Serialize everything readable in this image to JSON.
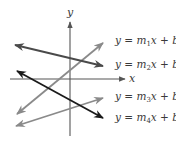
{
  "diagram": {
    "axes": {
      "x_label": "x",
      "y_label": "y",
      "axis_color": "#555555"
    },
    "lines": [
      {
        "id": "line-1",
        "label": "y = m1x + b1",
        "label_parts": {
          "prefix": "y = ",
          "m": "m",
          "m_sub": "1",
          "x": "x",
          "plus": " + ",
          "b": "b",
          "b_sub": "1"
        },
        "direction": "rising",
        "color": "#8a8a8a"
      },
      {
        "id": "line-2",
        "label": "y = m2x + b2",
        "label_parts": {
          "prefix": "y = ",
          "m": "m",
          "m_sub": "2",
          "x": "x",
          "plus": " + ",
          "b": "b",
          "b_sub": "2"
        },
        "direction": "falling",
        "color": "#4a4a4a"
      },
      {
        "id": "line-3",
        "label": "y = m3x + b3",
        "label_parts": {
          "prefix": "y = ",
          "m": "m",
          "m_sub": "3",
          "x": "x",
          "plus": " + ",
          "b": "b",
          "b_sub": "3"
        },
        "direction": "rising",
        "color": "#8a8a8a"
      },
      {
        "id": "line-4",
        "label": "y = m4x + b4",
        "label_parts": {
          "prefix": "y = ",
          "m": "m",
          "m_sub": "4",
          "x": "x",
          "plus": " + ",
          "b": "b",
          "b_sub": "4"
        },
        "direction": "falling",
        "color": "#1a1a1a"
      }
    ]
  }
}
